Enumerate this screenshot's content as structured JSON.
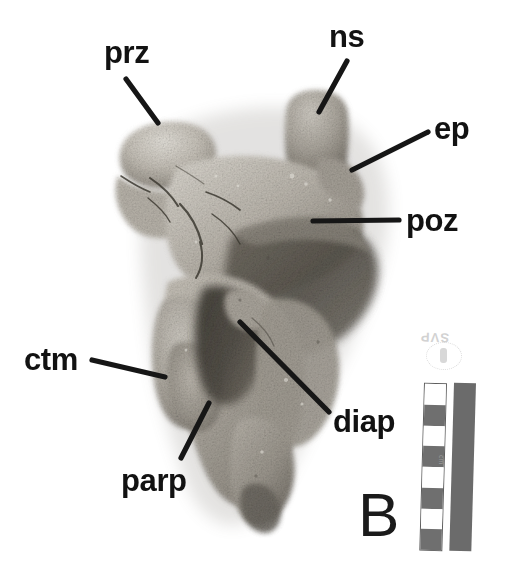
{
  "figure": {
    "panel_letter": "B",
    "background_color": "#ffffff",
    "label_color": "#121212",
    "specimen_tone_light": "#c9c5be",
    "specimen_tone_mid": "#9a958d",
    "specimen_tone_dark": "#5c584f"
  },
  "annotations": [
    {
      "id": "prz",
      "label": "prz",
      "x": 104,
      "y": 37,
      "leader": {
        "x1": 126,
        "y1": 79,
        "x2": 158,
        "y2": 123
      }
    },
    {
      "id": "ns",
      "label": "ns",
      "x": 329,
      "y": 21,
      "leader": {
        "x1": 347,
        "y1": 61,
        "x2": 319,
        "y2": 112
      }
    },
    {
      "id": "ep",
      "label": "ep",
      "x": 434,
      "y": 113,
      "leader": {
        "x1": 428,
        "y1": 132,
        "x2": 352,
        "y2": 170
      }
    },
    {
      "id": "poz",
      "label": "poz",
      "x": 406,
      "y": 205,
      "leader": {
        "x1": 399,
        "y1": 220,
        "x2": 313,
        "y2": 221
      }
    },
    {
      "id": "ctm",
      "label": "ctm",
      "x": 24,
      "y": 344,
      "leader": {
        "x1": 92,
        "y1": 360,
        "x2": 165,
        "y2": 377
      }
    },
    {
      "id": "parp",
      "label": "parp",
      "x": 121,
      "y": 465,
      "leader": {
        "x1": 181,
        "y1": 458,
        "x2": 209,
        "y2": 403
      }
    },
    {
      "id": "diap",
      "label": "diap",
      "x": 333,
      "y": 406,
      "leader": {
        "x1": 329,
        "y1": 412,
        "x2": 240,
        "y2": 322
      }
    }
  ],
  "scale_bar": {
    "name": "photographic scale bar",
    "checkered_segments": 8,
    "segment_pattern": [
      "light",
      "dark",
      "light",
      "dark",
      "light",
      "dark",
      "light",
      "dark"
    ],
    "tick_text": "cm",
    "solid_bar_color": "#6b6b6b",
    "checker_dark_color": "#6f6f6f",
    "checker_light_color": "#ffffff"
  },
  "stamp": {
    "text": "SVP",
    "note": "faint inverted stamp above scale bar"
  }
}
